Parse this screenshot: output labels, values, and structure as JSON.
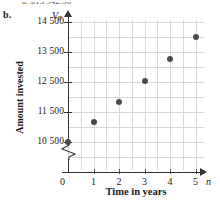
{
  "part_label": "b.",
  "cutoff_text": "a. $13 942.56",
  "chart_data": {
    "type": "scatter",
    "title": "",
    "xlabel": "Time in years",
    "ylabel": "Amount invested",
    "x_axis_symbol": "n",
    "y_axis_symbol": "V",
    "y_axis_symbol_sub": "n",
    "x": [
      0,
      1,
      2,
      3,
      4,
      5
    ],
    "values": [
      10500,
      11170,
      11850,
      12550,
      13270,
      14000
    ],
    "categories": [
      "0",
      "1",
      "2",
      "3",
      "4",
      "5"
    ],
    "xlim": [
      0,
      5.4
    ],
    "ylim": [
      10500,
      14500
    ],
    "y_axis_break": true,
    "xticks": [
      "0",
      "1",
      "2",
      "3",
      "4",
      "5"
    ],
    "yticks": [
      "10 500",
      "11 500",
      "12 500",
      "13 500",
      "14 500"
    ],
    "ytick_values": [
      10500,
      11500,
      12500,
      13500,
      14500
    ],
    "grid": true,
    "legend": "none",
    "point_color": "#4a4a4a",
    "grid_color": "#d8d8d8",
    "axis_color": "#333333"
  }
}
